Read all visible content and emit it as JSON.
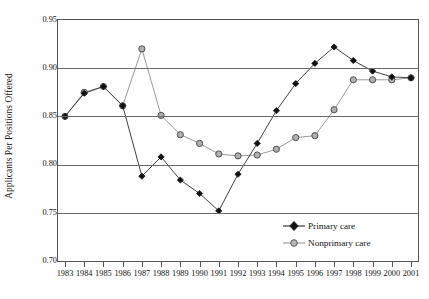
{
  "chart_data": {
    "type": "line",
    "title": "",
    "xlabel": "",
    "ylabel": "Applicants Per Positions Offered",
    "x": [
      1983,
      1984,
      1985,
      1986,
      1987,
      1988,
      1989,
      1990,
      1991,
      1992,
      1993,
      1994,
      1995,
      1996,
      1997,
      1998,
      1999,
      2000,
      2001
    ],
    "categories": [
      "1983",
      "1984",
      "1985",
      "1986",
      "1987",
      "1988",
      "1989",
      "1990",
      "1991",
      "1992",
      "1993",
      "1994",
      "1995",
      "1996",
      "1997",
      "1998",
      "1999",
      "2000",
      "2001"
    ],
    "series": [
      {
        "name": "Primary care",
        "marker": "filled-diamond",
        "color": "#111111",
        "values": [
          0.85,
          0.874,
          0.881,
          0.861,
          0.788,
          0.808,
          0.784,
          0.77,
          0.752,
          0.79,
          0.822,
          0.856,
          0.884,
          0.905,
          0.922,
          0.908,
          0.897,
          0.891,
          0.89
        ]
      },
      {
        "name": "Nonprimary care",
        "marker": "open-circle",
        "color": "#999999",
        "values": [
          0.85,
          0.875,
          0.881,
          0.861,
          0.92,
          0.851,
          0.831,
          0.822,
          0.811,
          0.809,
          0.81,
          0.816,
          0.828,
          0.83,
          0.857,
          0.888,
          0.888,
          0.888,
          0.89
        ]
      }
    ],
    "ylim": [
      0.7,
      0.95
    ],
    "yticks": [
      0.7,
      0.75,
      0.8,
      0.85,
      0.9,
      0.95
    ],
    "ytick_labels": [
      "0.70",
      "0.75",
      "0.80",
      "0.85",
      "0.90",
      "0.95"
    ],
    "grid": "horizontal",
    "legend_position": "bottom-right",
    "legend": [
      "Primary care",
      "Nonprimary care"
    ]
  },
  "colors": {
    "primary_care": "#111111",
    "nonprimary_care": "#999999",
    "marker_fill_nonprimary": "#a8a8a8",
    "gridline": "#6a6a6a",
    "axis": "#555555",
    "background": "#ffffff"
  }
}
